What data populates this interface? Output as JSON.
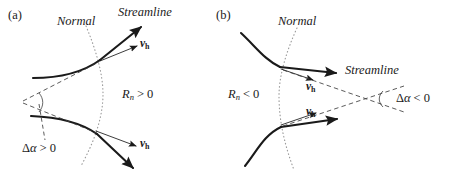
{
  "figure": {
    "type": "scientific-diagram",
    "background_color": "#ffffff",
    "stroke_color": "#1a1a1a",
    "dotted_color": "#999999",
    "dashed_color": "#4d4d4d"
  },
  "panels": [
    {
      "id": "a",
      "tag": "(a)",
      "labels": {
        "normal": "Normal",
        "streamline": "Streamline",
        "velocity_upper": "v",
        "velocity_upper_sub": "h",
        "velocity_lower": "v",
        "velocity_lower_sub": "h",
        "radius_symbol": "R",
        "radius_sub": "n",
        "radius_relation": "> 0",
        "radius_full": "R_n > 0",
        "delta_symbol": "Δ",
        "delta_alpha": "α",
        "delta_relation": "> 0",
        "delta_full": "Δα > 0"
      }
    },
    {
      "id": "b",
      "tag": "(b)",
      "labels": {
        "normal": "Normal",
        "streamline": "Streamline",
        "velocity_upper": "v",
        "velocity_upper_sub": "h",
        "velocity_lower": "v",
        "velocity_lower_sub": "h",
        "radius_symbol": "R",
        "radius_sub": "n",
        "radius_relation": "< 0",
        "radius_full": "R_n < 0",
        "delta_symbol": "Δ",
        "delta_alpha": "α",
        "delta_relation": "< 0",
        "delta_full": "Δα < 0"
      }
    }
  ]
}
